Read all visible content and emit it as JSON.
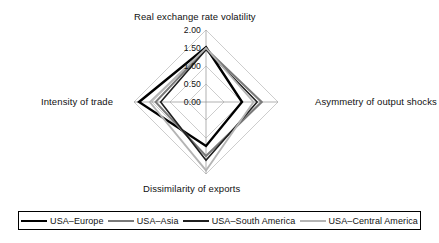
{
  "chart_data": {
    "type": "radar",
    "title": "",
    "axes": [
      "Real exchange rate volatility",
      "Asymmetry of output shocks",
      "Dissimilarity of exports",
      "Intensity of trade"
    ],
    "tick_labels": [
      "0.00",
      "0.50",
      "1.00",
      "1.50",
      "2.00"
    ],
    "tick_values": [
      0.0,
      0.5,
      1.0,
      1.5,
      2.0
    ],
    "rlim": [
      0.0,
      2.0
    ],
    "grid": true,
    "legend_position": "bottom",
    "series": [
      {
        "name": "USA–Europe",
        "color": "#000000",
        "width": 2.4,
        "values": [
          1.52,
          1.0,
          1.22,
          1.86
        ]
      },
      {
        "name": "USA–Asia",
        "color": "#7a7a7a",
        "width": 2.0,
        "values": [
          1.48,
          1.55,
          1.5,
          1.4
        ]
      },
      {
        "name": "USA–South America",
        "color": "#1f1f1f",
        "width": 1.6,
        "values": [
          1.45,
          1.42,
          1.62,
          1.26
        ]
      },
      {
        "name": "USA–Central America",
        "color": "#b4b4b4",
        "width": 1.8,
        "values": [
          1.5,
          1.32,
          1.9,
          1.56
        ]
      }
    ]
  },
  "axis_titles": {
    "top": "Real exchange rate volatility",
    "right": "Asymmetry of output shocks",
    "bottom": "Dissimilarity of exports",
    "left": "Intensity of trade"
  },
  "ticks": [
    {
      "label": "2.00"
    },
    {
      "label": "1.50"
    },
    {
      "label": "1.00"
    },
    {
      "label": "0.50"
    },
    {
      "label": "0.00"
    }
  ],
  "legend": {
    "items": [
      {
        "label": "USA–Europe",
        "color": "#000000",
        "width": 2.8
      },
      {
        "label": "USA–Asia",
        "color": "#7a7a7a",
        "width": 2.4
      },
      {
        "label": "USA–South America",
        "color": "#1f1f1f",
        "width": 2.4
      },
      {
        "label": "USA–Central America",
        "color": "#b4b4b4",
        "width": 2.4
      }
    ]
  },
  "geometry": {
    "cx": 206,
    "cy": 102,
    "radius": 72
  }
}
